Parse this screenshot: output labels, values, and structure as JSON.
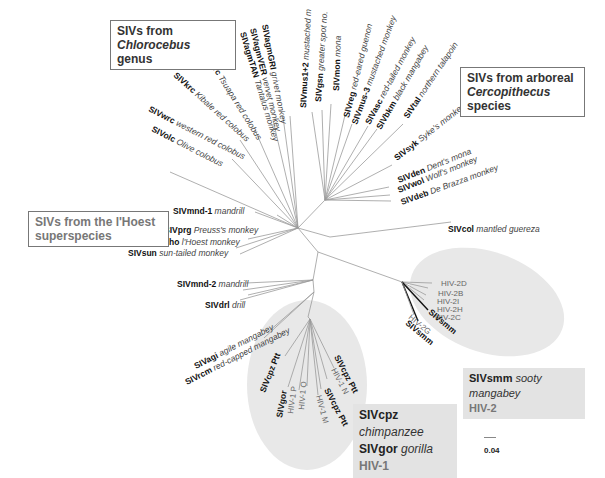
{
  "title_boxes": {
    "chlorocebus": {
      "prefix": "SIVs from ",
      "genus": "Chlorocebus",
      "suffix": "genus"
    },
    "arboreal": {
      "line1": "SIVs from arboreal",
      "genus": "Cercopithecus",
      "suffix": " species"
    },
    "lhoest": {
      "line1": "SIVs from the l'Hoest",
      "line2": "superspecies"
    }
  },
  "legends": {
    "hiv2": {
      "code": "SIVsmm",
      "host": "sooty mangabey",
      "hiv": "HIV-2"
    },
    "hiv1": {
      "row1_code": "SIVcpz",
      "row1_host": "chimpanzee",
      "row2_code": "SIVgor",
      "row2_host": "gorilla",
      "hiv": "HIV-1"
    }
  },
  "scale_bar": {
    "label": "0.04"
  },
  "colors": {
    "ellipse_fill": "#e8e8e8",
    "branch": "#9a9a9a",
    "legend_bg": "#e3e3e3"
  },
  "taxa": [
    {
      "code": "SIVolc",
      "host": "Olive colobus"
    },
    {
      "code": "SIVwrc",
      "host": "western red colobus"
    },
    {
      "code": "SIVkrc",
      "host": "Kibale red colobus"
    },
    {
      "code": "SIVtrc",
      "host": "Tsuapa red colobus"
    },
    {
      "code": "SIVagmTAN",
      "host": "Tantalus monkey"
    },
    {
      "code": "SIVagmVER",
      "host": "vervet monkey"
    },
    {
      "code": "SIVagmGRI",
      "host": "grivet monkey"
    },
    {
      "code": "SIVmus1+2",
      "host": "mustached m"
    },
    {
      "code": "SIVgsn",
      "host": "greater spot no."
    },
    {
      "code": "SIVmon",
      "host": "mona"
    },
    {
      "code": "SIVreg",
      "host": "red-eared guenon"
    },
    {
      "code": "SIVmus-3",
      "host": "mustached monkey"
    },
    {
      "code": "SIVasc",
      "host": "red-tailed monkey"
    },
    {
      "code": "SIVbkm",
      "host": "black mangabey"
    },
    {
      "code": "SIVtal",
      "host": "northern talapoin"
    },
    {
      "code": "SIVsyk",
      "host": "Syke's monkey"
    },
    {
      "code": "SIVden",
      "host": "Dent's mona"
    },
    {
      "code": "SIVwol",
      "host": "Wolf's monkey"
    },
    {
      "code": "SIVdeb",
      "host": "De Brazza monkey"
    },
    {
      "code": "SIVcol",
      "host": "mantled guereza"
    },
    {
      "code": "SIVmnd-1",
      "host": "mandrill"
    },
    {
      "code": "SIVprg",
      "host": "Preuss's monkey"
    },
    {
      "code": "SIVlho",
      "host": "l'Hoest monkey"
    },
    {
      "code": "SIVsun",
      "host": "sun-tailed monkey"
    },
    {
      "code": "SIVmnd-2",
      "host": "mandrill"
    },
    {
      "code": "SIVdrl",
      "host": "drill"
    },
    {
      "code": "SIVagi",
      "host": "agile mangabey"
    },
    {
      "code": "SIVrcm",
      "host": "red-capped mangabey"
    }
  ],
  "hiv1_clade": [
    {
      "code": "SIVcpz Ptt",
      "hiv": false
    },
    {
      "code": "SIVgor",
      "hiv": false
    },
    {
      "code": "HIV-1 P",
      "hiv": true
    },
    {
      "code": "HIV-1 O",
      "hiv": true
    },
    {
      "code": "HIV-1 M",
      "hiv": true
    },
    {
      "code": "SIVcpz Ptt",
      "hiv": false
    },
    {
      "code": "HIV-1 N",
      "hiv": true
    },
    {
      "code": "SIVcpz Ptt",
      "hiv": false
    }
  ],
  "hiv2_clade": [
    {
      "code": "HIV-2D",
      "hiv": true
    },
    {
      "code": "HIV-2B",
      "hiv": true
    },
    {
      "code": "HIV-2I",
      "hiv": true
    },
    {
      "code": "HIV-2H",
      "hiv": true
    },
    {
      "code": "HIV-2C",
      "hiv": true
    },
    {
      "code": "SIVsmm",
      "hiv": false
    },
    {
      "code": "HIV-2G",
      "hiv": true
    },
    {
      "code": "SIVsmm",
      "hiv": false
    }
  ]
}
